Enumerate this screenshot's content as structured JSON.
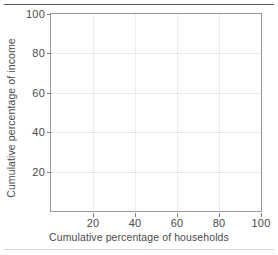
{
  "chart_data": {
    "type": "line",
    "title": "",
    "subtitle": "",
    "xlabel": "Cumulative percentage of households",
    "ylabel": "Cumulative percentage of income",
    "xlim": [
      0,
      100
    ],
    "ylim": [
      0,
      100
    ],
    "xticks": [
      20,
      40,
      60,
      80,
      100
    ],
    "yticks": [
      20,
      40,
      60,
      80,
      100
    ],
    "xtick_labels": [
      "20",
      "40",
      "60",
      "80",
      "100"
    ],
    "ytick_labels": [
      "20",
      "40",
      "60",
      "80",
      "100"
    ],
    "grid": true,
    "grid_style": "dotted",
    "legend": null,
    "legend_position": "none",
    "series": [],
    "annotations": [],
    "note": "Empty Lorenz-curve axes; no data plotted"
  },
  "figure": {
    "top_rule_label": "top-divider-rule",
    "bottom_rule_label": "bottom-divider-rule"
  },
  "colors": {
    "axis": "#9a9b9e",
    "tick": "#7c7d80",
    "grid": "#d8d9db",
    "text": "#4a4b4d",
    "rule_top": "#58595b",
    "rule_bottom": "#d2d3d5",
    "background": "#ffffff"
  }
}
